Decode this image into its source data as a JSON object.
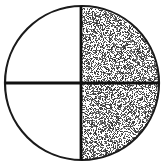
{
  "figure": {
    "kind": "fraction-circle-diagram",
    "title": "Circle divided into four quadrants with the right half shaded",
    "canvas": {
      "width": 166,
      "height": 166,
      "background_color": "#FFFFFF"
    },
    "circle": {
      "center_x": 82,
      "center_y": 83,
      "radius": 77,
      "outline_color": "#1A1A1A",
      "outline_width": 2.2,
      "fill_color": "#FFFFFF"
    },
    "dividers": [
      {
        "name": "vertical-diameter",
        "orientation": "vertical",
        "x1": 81,
        "y1": 6,
        "x2": 81,
        "y2": 160,
        "color": "#111111",
        "width": 2.8
      },
      {
        "name": "horizontal-diameter",
        "orientation": "horizontal",
        "x1": 5,
        "y1": 83,
        "x2": 159,
        "y2": 83,
        "color": "#111111",
        "width": 2.8
      }
    ],
    "quadrants": [
      {
        "name": "top-left",
        "position": "upper-left",
        "shaded": false,
        "fill": "white"
      },
      {
        "name": "top-right",
        "position": "upper-right",
        "shaded": true,
        "fill": "stipple"
      },
      {
        "name": "bottom-left",
        "position": "lower-left",
        "shaded": false,
        "fill": "white"
      },
      {
        "name": "bottom-right",
        "position": "lower-right",
        "shaded": true,
        "fill": "stipple"
      }
    ],
    "shading": {
      "style": "random-stipple",
      "dot_color": "#262626",
      "coverage_percent": 50,
      "region": "right-half",
      "seed": 20240117
    },
    "fraction_shaded": {
      "numerator": 2,
      "denominator": 4,
      "label": "2/4"
    }
  }
}
